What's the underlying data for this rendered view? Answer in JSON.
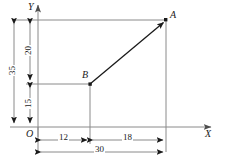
{
  "figure": {
    "type": "geometry-diagram",
    "axes": {
      "x_label": "X",
      "y_label": "Y",
      "origin_label": "O"
    },
    "points": [
      {
        "name": "A",
        "label": "A",
        "x": 30,
        "y": 35
      },
      {
        "name": "B",
        "label": "B",
        "x": 12,
        "y": 15
      }
    ],
    "vertical_dimensions": [
      {
        "name": "total-height",
        "label": "35",
        "from": 0,
        "to": 35
      },
      {
        "name": "upper-height",
        "label": "20",
        "from": 15,
        "to": 35
      },
      {
        "name": "lower-height",
        "label": "15",
        "from": 0,
        "to": 15
      }
    ],
    "horizontal_dimensions": [
      {
        "name": "left-width",
        "label": "12",
        "from": 0,
        "to": 12
      },
      {
        "name": "right-width",
        "label": "18",
        "from": 12,
        "to": 30
      },
      {
        "name": "total-width",
        "label": "30",
        "from": 0,
        "to": 30
      }
    ],
    "segments": [
      {
        "name": "segment-BA",
        "from": "B",
        "to": "A"
      }
    ],
    "colors": {
      "stroke": "#808080",
      "segment": "#1a1a1a",
      "text": "#1a1a1a",
      "background": "#ffffff"
    }
  }
}
